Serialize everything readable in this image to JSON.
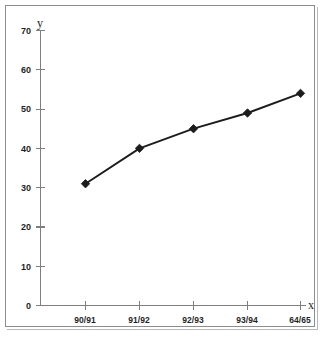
{
  "chart_data": {
    "type": "line",
    "title": "",
    "subtitle": "",
    "xlabel": "x",
    "ylabel": "y",
    "categories": [
      "90/91",
      "91/92",
      "92/93",
      "93/94",
      "64/65"
    ],
    "values": [
      31,
      40,
      45,
      49,
      54
    ],
    "series": [
      {
        "name": "",
        "values": [
          31,
          40,
          45,
          49,
          54
        ]
      }
    ],
    "ylim": [
      0,
      70
    ],
    "yticks": [
      0,
      10,
      20,
      30,
      40,
      50,
      60,
      70
    ],
    "ytick_labels": [
      "0",
      "10",
      "20",
      "30",
      "40",
      "50",
      "60",
      "70"
    ],
    "grid": false,
    "legend": false,
    "legend_position": "none",
    "marker": "diamond",
    "colors": {
      "series": "#1c1c1c",
      "axis": "#7f7f7f",
      "text": "#1f1f1f",
      "frame": "#8d8d8d",
      "background": "#ffffff"
    }
  },
  "axis_titles": {
    "y": "y",
    "x": "x"
  },
  "y_ticks": [
    {
      "label": "70",
      "value": 70
    },
    {
      "label": "60",
      "value": 60
    },
    {
      "label": "50",
      "value": 50
    },
    {
      "label": "40",
      "value": 40
    },
    {
      "label": "30",
      "value": 30
    },
    {
      "label": "20",
      "value": 20
    },
    {
      "label": "10",
      "value": 10
    },
    {
      "label": "0",
      "value": 0
    }
  ],
  "x_ticks": [
    {
      "label": "90/91"
    },
    {
      "label": "91/92"
    },
    {
      "label": "92/93"
    },
    {
      "label": "93/94"
    },
    {
      "label": "64/65"
    }
  ]
}
